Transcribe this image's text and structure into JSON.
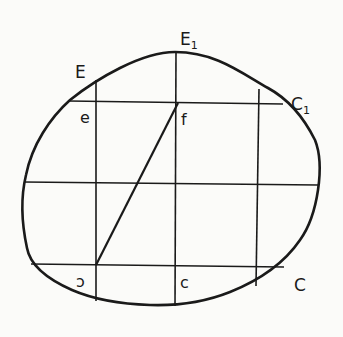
{
  "diagram": {
    "type": "geometric-figure",
    "colors": {
      "stroke": "#1a1a1a",
      "background": "#fbfbf9"
    },
    "labels": {
      "E": "E",
      "E1": "E",
      "E1_sub": "1",
      "C1": "C",
      "C1_sub": "1",
      "C": "C",
      "e": "e",
      "f": "f",
      "s": "ↄ",
      "c": "c"
    },
    "grid": {
      "vertical_x": [
        96,
        176,
        257
      ],
      "horizontal_y": [
        103,
        183,
        265
      ]
    },
    "diagonal": {
      "from": "s",
      "to": "f"
    }
  }
}
